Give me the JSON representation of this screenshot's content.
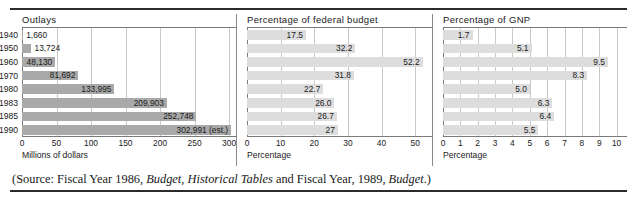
{
  "figure": {
    "source_prefix": "(Source: Fiscal Year 1986, ",
    "source_italic_1": "Budget, Historical Tables",
    "source_middle": " and Fiscal Year, 1989, ",
    "source_italic_2": "Budget",
    "source_suffix": ".)",
    "colors": {
      "bar_dark": "#a9a9a9",
      "bar_light": "#dddddd",
      "gridline": "#c9c9c9",
      "axis": "#7a7a7a",
      "rule": "#2b2b2b"
    }
  },
  "chart_data": [
    {
      "type": "bar",
      "title": "Outlays",
      "orientation": "horizontal",
      "categories": [
        "1940",
        "1950",
        "1960",
        "1970",
        "1980",
        "1983",
        "1985",
        "1990"
      ],
      "values": [
        1660,
        13724,
        48130,
        81692,
        133995,
        209903,
        252748,
        302991
      ],
      "value_labels": [
        "1,660",
        "13,724",
        "48,130",
        "81,692",
        "133,995",
        "209,903",
        "252,748",
        "302,991 (est.)"
      ],
      "xlabel": "Millions of dollars",
      "ylabel": "",
      "xlim": [
        0,
        310
      ],
      "ticks": [
        "0",
        "50",
        "100",
        "150",
        "200",
        "250",
        "300"
      ],
      "tick_values": [
        0,
        50,
        100,
        150,
        200,
        250,
        300
      ],
      "tick_scale": 1000,
      "grid": true,
      "legend": "none"
    },
    {
      "type": "bar",
      "title": "Percentage of federal budget",
      "orientation": "horizontal",
      "categories": [
        "1940",
        "1950",
        "1960",
        "1970",
        "1980",
        "1983",
        "1985",
        "1990"
      ],
      "values": [
        17.5,
        32.2,
        52.2,
        31.8,
        22.7,
        26.0,
        26.7,
        27
      ],
      "value_labels": [
        "17.5",
        "32.2",
        "52.2",
        "31.8",
        "22.7",
        "26.0",
        "26.7",
        "27"
      ],
      "xlabel": "Percentage",
      "ylabel": "",
      "xlim": [
        0,
        55
      ],
      "ticks": [
        "0",
        "10",
        "20",
        "30",
        "40",
        "50"
      ],
      "tick_values": [
        0,
        10,
        20,
        30,
        40,
        50
      ],
      "grid": true,
      "legend": "none"
    },
    {
      "type": "bar",
      "title": "Percentage of GNP",
      "orientation": "horizontal",
      "categories": [
        "1940",
        "1950",
        "1960",
        "1970",
        "1980",
        "1983",
        "1985",
        "1990"
      ],
      "values": [
        1.7,
        5.1,
        9.5,
        8.3,
        5.0,
        6.3,
        6.4,
        5.5
      ],
      "value_labels": [
        "1.7",
        "5.1",
        "9.5",
        "8.3",
        "5.0",
        "6.3",
        "6.4",
        "5.5"
      ],
      "xlabel": "Percentage",
      "ylabel": "",
      "xlim": [
        0,
        10.6
      ],
      "ticks": [
        "0",
        "1",
        "2",
        "3",
        "4",
        "5",
        "6",
        "7",
        "8",
        "9",
        "10"
      ],
      "tick_values": [
        0,
        1,
        2,
        3,
        4,
        5,
        6,
        7,
        8,
        9,
        10
      ],
      "grid": true,
      "legend": "none"
    }
  ]
}
